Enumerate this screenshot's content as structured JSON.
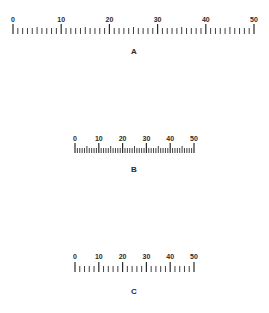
{
  "figure": {
    "background": "#ffffff",
    "ink_color": "#2a2a2a"
  },
  "rulers": [
    {
      "id": "A",
      "caption": "A",
      "min": 0,
      "max": 50,
      "labels": [
        "0",
        "10",
        "20",
        "30",
        "40",
        "50"
      ],
      "label_interval": 10,
      "minor_interval": 1,
      "medium_interval": 5,
      "geometry": {
        "x0": 13,
        "x1": 254,
        "label_y": 22,
        "tick_base_y": 34,
        "major_len": 10,
        "medium_len": 7,
        "minor_len": 6,
        "caption_x": 134,
        "caption_y": 48
      }
    },
    {
      "id": "B",
      "caption": "B",
      "min": 0,
      "max": 50,
      "labels": [
        "0",
        "10",
        "20",
        "30",
        "40",
        "50"
      ],
      "label_interval": 10,
      "minor_interval": 1,
      "medium_interval": 5,
      "geometry": {
        "x0": 75,
        "x1": 194,
        "label_y": 141,
        "tick_base_y": 153,
        "major_len": 10,
        "medium_len": 7,
        "minor_len": 5,
        "caption_x": 134,
        "caption_y": 166
      }
    },
    {
      "id": "C",
      "caption": "C",
      "min": 0,
      "max": 50,
      "labels": [
        "0",
        "10",
        "20",
        "30",
        "40",
        "50"
      ],
      "label_interval": 10,
      "minor_interval": 2,
      "medium_interval": null,
      "geometry": {
        "x0": 75,
        "x1": 194,
        "label_y": 259,
        "tick_base_y": 272,
        "major_len": 10,
        "medium_len": 6,
        "minor_len": 6,
        "caption_x": 134,
        "caption_y": 288
      }
    }
  ]
}
